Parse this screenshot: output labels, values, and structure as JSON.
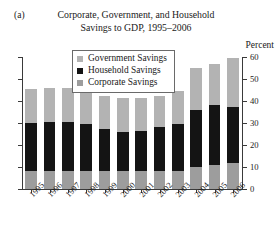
{
  "panel": {
    "label": "(a)"
  },
  "title": {
    "line1": "Corporate, Government, and Household",
    "line2": "Savings to GDP, 1995–2006"
  },
  "axis": {
    "unit_label": "Percent",
    "y_ticks": [
      "0",
      "10",
      "20",
      "30",
      "40",
      "50",
      "60"
    ]
  },
  "legend": {
    "items": [
      {
        "label": "Government Savings",
        "color": "#b3b3b3"
      },
      {
        "label": "Household Savings",
        "color": "#141414"
      },
      {
        "label": "Corporate Savings",
        "color": "#9d9d9d"
      }
    ]
  },
  "chart_data": {
    "type": "bar",
    "stacked": true,
    "title": "Corporate, Government, and Household Savings to GDP, 1995–2006",
    "xlabel": "",
    "ylabel": "Percent",
    "ylim": [
      0,
      60
    ],
    "yticks": [
      0,
      10,
      20,
      30,
      40,
      50,
      60
    ],
    "grid": false,
    "legend_position": "top-center",
    "categories": [
      "1995",
      "1996",
      "1997",
      "1998",
      "1999",
      "2000",
      "2001",
      "2002",
      "2003",
      "2004",
      "2005",
      "2006"
    ],
    "series": [
      {
        "name": "Corporate Savings",
        "color": "#9d9d9d",
        "values": [
          8.0,
          8.0,
          8.0,
          8.0,
          8.0,
          8.0,
          8.0,
          8.0,
          8.0,
          10.0,
          11.0,
          12.0
        ]
      },
      {
        "name": "Household Savings",
        "color": "#141414",
        "values": [
          22.0,
          22.5,
          22.5,
          21.5,
          19.5,
          18.0,
          18.5,
          20.0,
          21.5,
          26.0,
          27.0,
          25.5
        ]
      },
      {
        "name": "Government Savings",
        "color": "#b3b3b3",
        "values": [
          15.5,
          15.5,
          15.5,
          14.5,
          15.0,
          15.5,
          15.0,
          14.5,
          15.0,
          19.0,
          19.0,
          22.0
        ]
      }
    ],
    "totals": [
      45.5,
      46.0,
      46.0,
      44.0,
      42.5,
      41.5,
      41.5,
      42.5,
      44.5,
      55.0,
      57.0,
      59.5
    ]
  }
}
